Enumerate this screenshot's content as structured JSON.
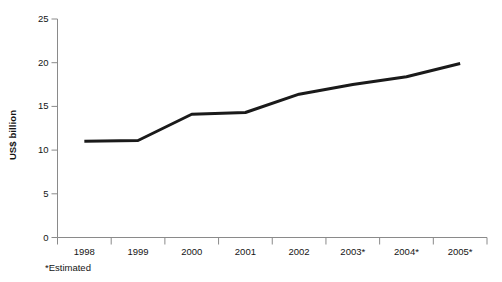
{
  "chart_data": {
    "type": "line",
    "title": "",
    "subtitle": "",
    "xlabel": "",
    "ylabel": "US$ billion",
    "categories": [
      "1998",
      "1999",
      "2000",
      "2001",
      "2002",
      "2003*",
      "2004*",
      "2005*"
    ],
    "values": [
      11.0,
      11.1,
      14.1,
      14.3,
      16.4,
      17.5,
      18.4,
      19.9
    ],
    "series": [
      {
        "name": "US$ billion",
        "values": [
          11.0,
          11.1,
          14.1,
          14.3,
          16.4,
          17.5,
          18.4,
          19.9
        ]
      }
    ],
    "ylim": [
      0,
      25
    ],
    "yticks": [
      0,
      5,
      10,
      15,
      20,
      25
    ],
    "ytick_labels": [
      "0",
      "5",
      "10",
      "15",
      "20",
      "25"
    ],
    "xtick_labels": [
      "1998",
      "1999",
      "2000",
      "2001",
      "2002",
      "2003*",
      "2004*",
      "2005*"
    ],
    "grid": false,
    "legend": false,
    "legend_position": "none",
    "annotations": [
      "*Estimated"
    ],
    "line_color": "#1a1a1a",
    "axis_color": "#8a8a8a",
    "background_color": "#ffffff"
  },
  "footnote": {
    "text": "*Estimated"
  },
  "axis": {
    "y_title": "US$ billion"
  }
}
